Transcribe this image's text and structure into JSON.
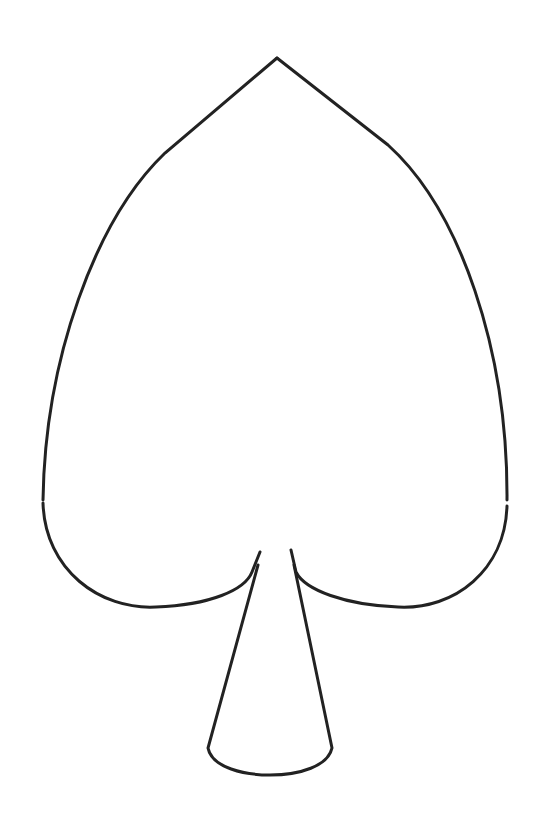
{
  "figure": {
    "shape": "spade",
    "stroke_color": "#222222",
    "background_color": "#ffffff",
    "stroke_width": 3
  }
}
